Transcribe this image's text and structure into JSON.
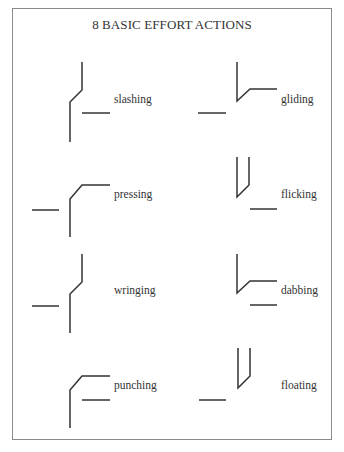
{
  "title": "8 BASIC EFFORT ACTIONS",
  "colors": {
    "line": "#333333",
    "border": "#8a8a8a",
    "background": "#ffffff"
  },
  "actions": [
    {
      "label": "slashing",
      "x": 114,
      "y": 93
    },
    {
      "label": "gliding",
      "x": 281,
      "y": 93
    },
    {
      "label": "pressing",
      "x": 114,
      "y": 188
    },
    {
      "label": "flicking",
      "x": 281,
      "y": 188
    },
    {
      "label": "wringing",
      "x": 114,
      "y": 284
    },
    {
      "label": "dabbing",
      "x": 281,
      "y": 284
    },
    {
      "label": "punching",
      "x": 114,
      "y": 379
    },
    {
      "label": "floating",
      "x": 281,
      "y": 379
    }
  ]
}
